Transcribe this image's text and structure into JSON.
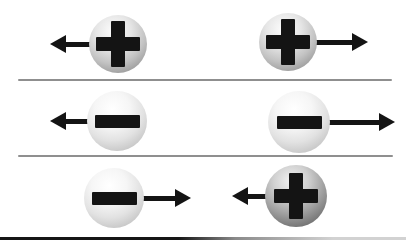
{
  "figure": {
    "type": "electrostatic-force-diagram",
    "background": "#ffffff"
  },
  "colors": {
    "symbol": "#141414",
    "arrow": "#141414",
    "divider": "#8f8f8f",
    "ground_dark": "#161616",
    "ground_light": "#d2d2d2"
  },
  "rows": [
    {
      "interaction": "repulsion",
      "particles": [
        {
          "charge": "+",
          "shade": "medium",
          "cx": 118,
          "cy": 44,
          "radius": 29,
          "arrow_direction": "left",
          "arrow_tip_x": 50
        },
        {
          "charge": "+",
          "shade": "medium",
          "cx": 288,
          "cy": 42,
          "radius": 29,
          "arrow_direction": "right",
          "arrow_tip_x": 368
        }
      ]
    },
    {
      "interaction": "repulsion",
      "particles": [
        {
          "charge": "−",
          "shade": "light",
          "cx": 117,
          "cy": 121,
          "radius": 30,
          "arrow_direction": "left",
          "arrow_tip_x": 50
        },
        {
          "charge": "−",
          "shade": "light",
          "cx": 299,
          "cy": 122,
          "radius": 31,
          "arrow_direction": "right",
          "arrow_tip_x": 395
        }
      ]
    },
    {
      "interaction": "attraction",
      "particles": [
        {
          "charge": "−",
          "shade": "light",
          "cx": 114,
          "cy": 198,
          "radius": 30,
          "arrow_direction": "right",
          "arrow_tip_x": 191
        },
        {
          "charge": "+",
          "shade": "dark",
          "cx": 296,
          "cy": 196,
          "radius": 31,
          "arrow_direction": "left",
          "arrow_tip_x": 232
        }
      ]
    }
  ]
}
